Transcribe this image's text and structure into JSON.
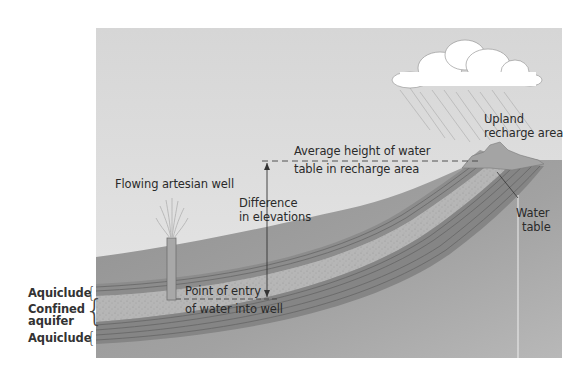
{
  "diagram": {
    "labels": {
      "flowing_well": "Flowing artesian well",
      "difference_line1": "Difference",
      "difference_line2": "in elevations",
      "avg_height_line1": "Average height of water",
      "avg_height_line2": "table in recharge area",
      "upland_line1": "Upland",
      "upland_line2": "recharge area",
      "water_table_line1": "Water",
      "water_table_line2": "table",
      "entry_line1": "Point of entry",
      "entry_line2": "of water into well"
    },
    "layers": {
      "aquiclude_top": "Aquiclude",
      "confined_aquifer_line1": "Confined",
      "confined_aquifer_line2": "aquifer",
      "aquiclude_bottom": "Aquiclude"
    },
    "colors": {
      "sky": "#d9d9d9",
      "ground": "#9a9a9a",
      "aquifer": "#b4b4b4",
      "aquiclude": "#8a8a8a",
      "cloud": "#ffffff",
      "text": "#2a2a2a"
    }
  }
}
